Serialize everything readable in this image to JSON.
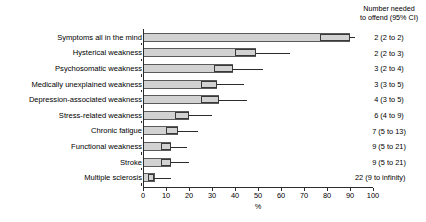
{
  "chart_data": {
    "type": "bar",
    "title": "",
    "xlabel": "%",
    "ylabel": "",
    "xlim": [
      0,
      100
    ],
    "xticks": [
      0,
      10,
      20,
      30,
      40,
      50,
      60,
      70,
      80,
      90,
      100
    ],
    "grid": false,
    "orientation": "horizontal",
    "legend": "none",
    "categories": [
      "Symptoms all in the mind",
      "Hysterical weakness",
      "Psychosomatic weakness",
      "Medically unexplained weakness",
      "Depression-associated weakness",
      "Stress-related weakness",
      "Chronic fatigue",
      "Functional weakness",
      "Stroke",
      "Multiple sclerosis"
    ],
    "values": [
      90,
      49,
      39,
      32,
      33,
      20,
      15,
      12,
      12,
      5
    ],
    "ci_low": [
      77,
      40,
      31,
      25,
      25,
      14,
      10,
      8,
      8,
      2
    ],
    "ci_high": [
      90,
      49,
      39,
      32,
      33,
      20,
      15,
      12,
      12,
      5
    ],
    "whisker_high": [
      92,
      64,
      52,
      44,
      45,
      30,
      24,
      19,
      20,
      12
    ],
    "right_column_header_line1": "Number needed",
    "right_column_header_line2": "to offend (95% CI)",
    "right_column_values": [
      "2 (2 to 2)",
      "2 (2 to 3)",
      "3 (2 to 4)",
      "3 (3 to 5)",
      "4 (3 to 5)",
      "6 (4 to 9)",
      "7 (5 to 13)",
      "9 (5 to 21)",
      "9 (5 to 21)",
      "22 (9 to infinity)"
    ],
    "colors": {
      "bar_fill": "#d2d2d2",
      "bar_border": "#5a5a5a",
      "ci_border": "#3a3a3a",
      "whisker": "#2b2b2b",
      "axis": "#2b2b2b",
      "text": "#000000",
      "background": "#ffffff"
    }
  }
}
